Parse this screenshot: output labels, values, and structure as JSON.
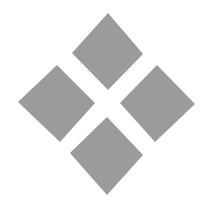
{
  "figure": {
    "background": "#ffffff",
    "fill_color": "#9b9b9b",
    "shapes": [
      {
        "name": "diamond-top",
        "points": "108,13 143,54 108,90 72,53"
      },
      {
        "name": "diamond-left",
        "points": "57,65 95,103 60,142 18,102"
      },
      {
        "name": "diamond-right",
        "points": "157,65 195,104 155,142 120,103"
      },
      {
        "name": "diamond-bottom",
        "points": "107,117 143,155 107,195 70,153"
      }
    ]
  }
}
